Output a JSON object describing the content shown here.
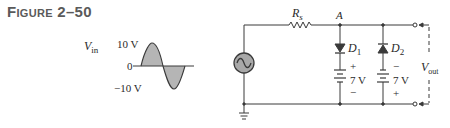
{
  "figure": {
    "title_prefix": "F",
    "title_smallcaps": "IGURE",
    "title_number": "2–50"
  },
  "waveform": {
    "signal_label": "V",
    "signal_subscript": "in",
    "max_label": "10 V",
    "zero_label": "0",
    "min_label": "−10 V",
    "amplitude_v": 10,
    "shape": "sine, one full cycle, shaded"
  },
  "circuit": {
    "source_icon": "ac-source-icon",
    "resistor_label": "R",
    "resistor_subscript": "s",
    "node_label": "A",
    "diode1": {
      "label": "D",
      "subscript": "1",
      "orientation": "anode-up (conducts downward)"
    },
    "diode2": {
      "label": "D",
      "subscript": "2",
      "orientation": "cathode-up (conducts upward)"
    },
    "battery1": {
      "voltage": "7 V",
      "top_polarity": "+",
      "bottom_polarity": "−"
    },
    "battery2": {
      "voltage": "7 V",
      "top_polarity": "−",
      "bottom_polarity": "+"
    },
    "output_label": "V",
    "output_subscript": "out",
    "ground_icon": "ground-icon"
  },
  "colors": {
    "line": "#3a3a3a",
    "wave_fill": "#b5b5b5",
    "source_fill": "#a8a8a8",
    "title": "#5a5a5a"
  }
}
